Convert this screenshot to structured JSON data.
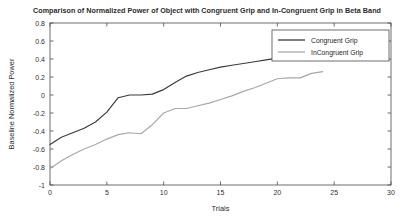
{
  "chart_data": {
    "type": "line",
    "title": "Comparison of Normalized Power of Object with Congruent Grip and In-Congruent Grip in Beta Band",
    "xlabel": "Trials",
    "ylabel": "Baseline Normalized Power",
    "xlim": [
      0,
      30
    ],
    "ylim": [
      -1,
      0.8
    ],
    "xticks": [
      "0",
      "5",
      "10",
      "15",
      "20",
      "25",
      "30"
    ],
    "xtick_values": [
      0,
      5,
      10,
      15,
      20,
      25,
      30
    ],
    "yticks": [
      "-1",
      "-0.8",
      "-0.6",
      "-0.4",
      "-0.2",
      "0",
      "0.2",
      "0.4",
      "0.6",
      "0.8"
    ],
    "ytick_values": [
      -1,
      -0.8,
      -0.6,
      -0.4,
      -0.2,
      0,
      0.2,
      0.4,
      0.6,
      0.8
    ],
    "grid": false,
    "legend_position": "top-right",
    "series": [
      {
        "name": "Congruent Grip",
        "color": "#3a3a3a",
        "x": [
          0,
          1,
          2,
          3,
          4,
          5,
          6,
          7,
          8,
          9,
          10,
          11,
          12,
          13,
          14,
          15,
          16,
          17,
          18,
          19,
          20,
          21,
          22,
          23,
          24
        ],
        "values": [
          -0.55,
          -0.47,
          -0.42,
          -0.37,
          -0.3,
          -0.19,
          -0.03,
          0.0,
          0.0,
          0.01,
          0.06,
          0.14,
          0.21,
          0.25,
          0.28,
          0.31,
          0.33,
          0.35,
          0.37,
          0.39,
          0.41,
          0.44,
          0.46,
          0.47,
          0.48
        ]
      },
      {
        "name": "InCongruent Grip",
        "color": "#a8a8a8",
        "x": [
          0,
          1,
          2,
          3,
          4,
          5,
          6,
          7,
          8,
          9,
          10,
          11,
          12,
          13,
          14,
          15,
          16,
          17,
          18,
          19,
          20,
          21,
          22,
          23,
          24
        ],
        "values": [
          -0.82,
          -0.73,
          -0.66,
          -0.6,
          -0.55,
          -0.49,
          -0.44,
          -0.42,
          -0.43,
          -0.33,
          -0.2,
          -0.15,
          -0.15,
          -0.12,
          -0.09,
          -0.05,
          -0.01,
          0.04,
          0.08,
          0.13,
          0.18,
          0.19,
          0.19,
          0.24,
          0.26
        ]
      }
    ]
  },
  "legend": {
    "entries": [
      {
        "label": "Congruent Grip"
      },
      {
        "label": "InCongruent Grip"
      }
    ]
  },
  "colors": {
    "congruent": "#3a3a3a",
    "incongruent": "#a8a8a8",
    "axis": "#4a4a4a",
    "background": "#ffffff"
  }
}
